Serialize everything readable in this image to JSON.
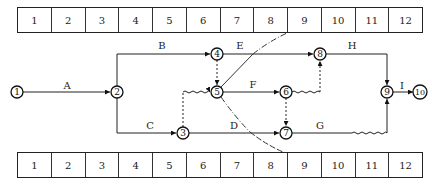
{
  "timescale_top": [
    "1",
    "2",
    "3",
    "4",
    "5",
    "6",
    "7",
    "8",
    "9",
    "10",
    "11",
    "12"
  ],
  "timescale_bottom": [
    "1",
    "2",
    "3",
    "4",
    "5",
    "6",
    "7",
    "8",
    "9",
    "10",
    "11",
    "12"
  ],
  "nodes": [
    {
      "id": "1",
      "x": 17,
      "y": 92
    },
    {
      "id": "2",
      "x": 117,
      "y": 92
    },
    {
      "id": "3",
      "x": 183,
      "y": 133
    },
    {
      "id": "4",
      "x": 217,
      "y": 54
    },
    {
      "id": "5",
      "x": 217,
      "y": 92
    },
    {
      "id": "6",
      "x": 286,
      "y": 92
    },
    {
      "id": "7",
      "x": 286,
      "y": 133
    },
    {
      "id": "8",
      "x": 320,
      "y": 54
    },
    {
      "id": "9",
      "x": 387,
      "y": 92
    },
    {
      "id": "10",
      "x": 420,
      "y": 92
    }
  ],
  "activities": [
    {
      "label": "A",
      "from": "1",
      "to": "2",
      "lx": 67,
      "ly": 89
    },
    {
      "label": "B",
      "from": "2",
      "to": "4",
      "lx": 162,
      "ly": 49
    },
    {
      "label": "C",
      "from": "2",
      "to": "3",
      "lx": 150,
      "ly": 129
    },
    {
      "label": "D",
      "from": "3",
      "to": "7",
      "lx": 234,
      "ly": 129
    },
    {
      "label": "E",
      "from": "4",
      "to": "8",
      "lx": 240,
      "ly": 49
    },
    {
      "label": "F",
      "from": "5",
      "to": "6",
      "lx": 253,
      "ly": 88
    },
    {
      "label": "G",
      "from": "7",
      "to": "9",
      "lx": 320,
      "ly": 129
    },
    {
      "label": "H",
      "from": "8",
      "to": "9",
      "lx": 352,
      "ly": 49
    },
    {
      "label": "I",
      "from": "9",
      "to": "10",
      "lx": 402,
      "ly": 89
    }
  ],
  "dummy_activities": [
    {
      "from": "4",
      "to": "5"
    },
    {
      "from": "3",
      "to": "5"
    },
    {
      "from": "6",
      "to": "8"
    },
    {
      "from": "6",
      "to": "7"
    }
  ],
  "free_float_waves": [
    {
      "after": "3",
      "description": "wavy segment 3 to 5"
    },
    {
      "after": "6",
      "description": "wavy segment 6 to 8"
    },
    {
      "after": "G",
      "description": "wavy segment on G before 9"
    }
  ],
  "check_line": {
    "style": "dash-dot",
    "top_at": "between 8 and 9",
    "bottom_at": "between 8 and 9"
  }
}
